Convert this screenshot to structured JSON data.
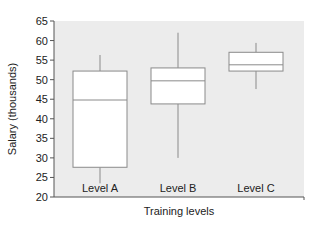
{
  "chart_data": {
    "type": "box",
    "title": "",
    "xlabel": "Training levels",
    "ylabel": "Salary (thousands)",
    "ylim": [
      20,
      65
    ],
    "yticks": [
      20,
      25,
      30,
      35,
      40,
      45,
      50,
      55,
      60,
      65
    ],
    "grid": false,
    "legend": null,
    "categories": [
      "Level A",
      "Level B",
      "Level C"
    ],
    "series": [
      {
        "name": "Level A",
        "whisker_low": 23.5,
        "q1": 27.6,
        "median": 44.8,
        "q3": 52.2,
        "whisker_high": 56.3
      },
      {
        "name": "Level B",
        "whisker_low": 30.0,
        "q1": 43.8,
        "median": 49.7,
        "q3": 53.0,
        "whisker_high": 62.0
      },
      {
        "name": "Level C",
        "whisker_low": 47.6,
        "q1": 52.2,
        "median": 53.8,
        "q3": 57.0,
        "whisker_high": 59.4
      }
    ],
    "colors": {
      "plot_bg": "#ececec",
      "box_fill": "#ffffff",
      "box_stroke": "#8a8a8a",
      "axis": "#555555"
    }
  }
}
